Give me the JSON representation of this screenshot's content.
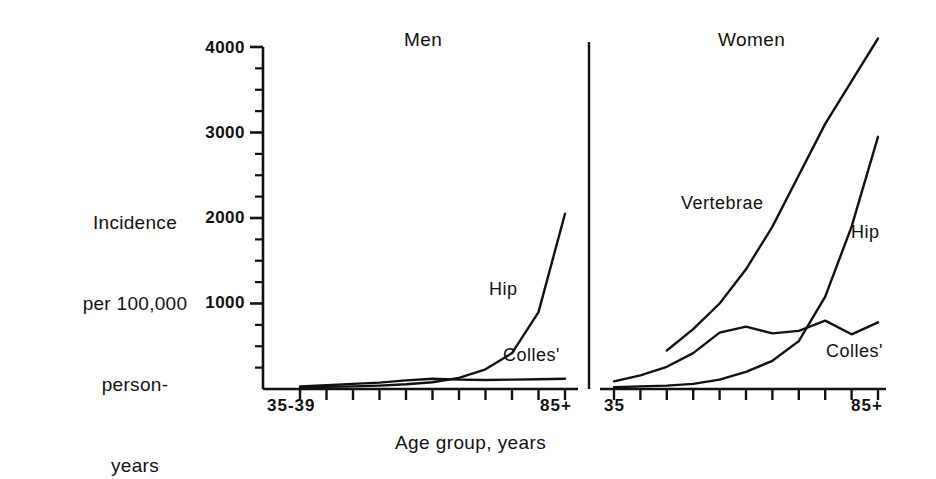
{
  "figure": {
    "background": "#ffffff",
    "ink_color": "#111111"
  },
  "axis": {
    "y_title_lines": [
      "Incidence",
      "per 100,000",
      "person-",
      "years"
    ],
    "x_title": "Age group, years",
    "y_ticks": [
      {
        "value": 4000,
        "label": "4000"
      },
      {
        "value": 3000,
        "label": "3000"
      },
      {
        "value": 2000,
        "label": "2000"
      },
      {
        "value": 1000,
        "label": "1000"
      }
    ],
    "y_minor_step": 250,
    "y_min": 0,
    "y_max": 4250
  },
  "panels": {
    "men": {
      "title": "Men",
      "x_label_left": "35-39",
      "x_label_right": "85+",
      "tick_count": 11,
      "curve_labels": {
        "hip": "Hip",
        "colles": "Colles'"
      }
    },
    "women": {
      "title": "Women",
      "x_label_left": "35",
      "x_label_right": "85+",
      "tick_count": 11,
      "curve_labels": {
        "vertebrae": "Vertebrae",
        "hip": "Hip",
        "colles": "Colles'"
      }
    }
  },
  "chart_data": {
    "type": "line",
    "xlabel": "Age group, years",
    "ylabel": "Incidence per 100,000 person-years",
    "ylim": [
      0,
      4250
    ],
    "grid": false,
    "legend": "inline-curve-labels",
    "panels": [
      {
        "name": "Men",
        "categories": [
          "35-39",
          "40-44",
          "45-49",
          "50-54",
          "55-59",
          "60-64",
          "65-69",
          "70-74",
          "75-79",
          "80-84",
          "85+"
        ],
        "series": [
          {
            "name": "Hip",
            "values": [
              20,
              25,
              30,
              40,
              55,
              80,
              130,
              230,
              420,
              900,
              2050
            ]
          },
          {
            "name": "Colles'",
            "values": [
              30,
              45,
              60,
              75,
              100,
              120,
              110,
              105,
              110,
              115,
              120
            ]
          }
        ]
      },
      {
        "name": "Women",
        "categories": [
          "35",
          "40",
          "45",
          "50",
          "55",
          "60",
          "65",
          "70",
          "75",
          "80",
          "85+"
        ],
        "series": [
          {
            "name": "Vertebrae",
            "values": [
              null,
              null,
              450,
              700,
              1000,
              1400,
              1900,
              2500,
              3100,
              3600,
              4100
            ]
          },
          {
            "name": "Hip",
            "values": [
              20,
              30,
              40,
              60,
              110,
              200,
              330,
              560,
              1080,
              1900,
              2950
            ]
          },
          {
            "name": "Colles'",
            "values": [
              90,
              160,
              260,
              420,
              660,
              730,
              650,
              680,
              800,
              640,
              780
            ]
          }
        ]
      }
    ]
  }
}
